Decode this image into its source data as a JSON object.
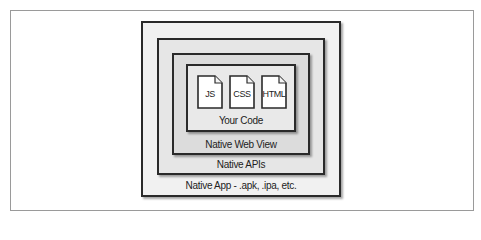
{
  "diagram": {
    "layers": [
      {
        "id": "native-app",
        "label": "Native App - .apk, .ipa, etc."
      },
      {
        "id": "native-apis",
        "label": "Native APIs"
      },
      {
        "id": "native-web-view",
        "label": "Native Web View"
      },
      {
        "id": "your-code",
        "label": "Your Code"
      }
    ],
    "files": [
      {
        "label": "JS",
        "icon": "document-icon"
      },
      {
        "label": "CSS",
        "icon": "document-icon"
      },
      {
        "label": "HTML",
        "icon": "document-icon"
      }
    ],
    "colors": {
      "border": "#2a2a2a",
      "frame_border": "#9a9a9a",
      "native_app_fill": "#f1f1f1",
      "native_apis_fill": "#e6e6e6",
      "native_web_view_fill": "#dcdcdc",
      "your_code_fill": "#e9e9e9",
      "file_fill": "#ffffff"
    }
  }
}
